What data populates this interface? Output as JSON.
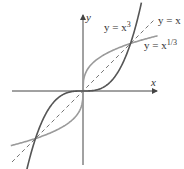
{
  "diagram": {
    "axes": {
      "x_label": "x",
      "y_label": "y"
    },
    "curves": [
      {
        "name": "cube",
        "label_prefix": "y = x",
        "label_exponent": "3",
        "color": "#555555"
      },
      {
        "name": "cube-root",
        "label_prefix": "y = x",
        "label_exponent": "1/3",
        "color": "#9a9a9a"
      },
      {
        "name": "identity",
        "label": "y = x",
        "color": "#555555",
        "dashed": true
      }
    ],
    "intersections": [
      [
        -1,
        -1
      ],
      [
        0,
        0
      ],
      [
        1,
        1
      ]
    ],
    "colors": {
      "axis": "#444444",
      "cube": "#555555",
      "cube_root": "#9a9a9a",
      "identity": "#666666"
    }
  }
}
